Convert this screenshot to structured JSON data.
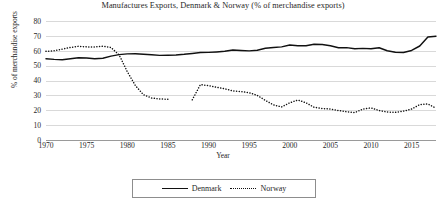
{
  "chart_data": {
    "type": "line",
    "title": "Manufactures Exports, Denmark & Norway (% of merchandise exports)",
    "xlabel": "Year",
    "ylabel": "% of merchandise exports",
    "ylim": [
      0,
      80
    ],
    "xlim": [
      1970,
      2018
    ],
    "ytick_labels": [
      "0",
      "10",
      "20",
      "30",
      "40",
      "50",
      "60",
      "70",
      "80"
    ],
    "ytick_values": [
      0,
      10,
      20,
      30,
      40,
      50,
      60,
      70,
      80
    ],
    "xtick_labels": [
      "1970",
      "1975",
      "1980",
      "1985",
      "1990",
      "1995",
      "2000",
      "2005",
      "2010",
      "2015"
    ],
    "xtick_values": [
      1970,
      1975,
      1980,
      1985,
      1990,
      1995,
      2000,
      2005,
      2010,
      2015
    ],
    "grid": "horizontal",
    "legend_position": "bottom-center",
    "series": [
      {
        "name": "Denmark",
        "style": "solid",
        "color": "#111111",
        "x": [
          1970,
          1971,
          1972,
          1973,
          1974,
          1975,
          1976,
          1977,
          1978,
          1979,
          1980,
          1981,
          1982,
          1983,
          1984,
          1985,
          1986,
          1987,
          1988,
          1989,
          1990,
          1991,
          1992,
          1993,
          1994,
          1995,
          1996,
          1997,
          1998,
          1999,
          2000,
          2001,
          2002,
          2003,
          2004,
          2005,
          2006,
          2007,
          2008,
          2009,
          2010,
          2011,
          2012,
          2013,
          2014,
          2015,
          2016,
          2017,
          2018
        ],
        "values": [
          54.6,
          54.2,
          54.0,
          54.6,
          55.3,
          55.1,
          54.6,
          55.0,
          56.4,
          57.4,
          57.9,
          58.0,
          57.6,
          57.3,
          56.9,
          57.0,
          57.2,
          57.6,
          58.2,
          58.8,
          58.9,
          59.2,
          59.6,
          60.5,
          60.2,
          59.9,
          60.3,
          61.7,
          62.2,
          62.6,
          63.9,
          63.4,
          63.4,
          64.4,
          64.2,
          63.4,
          62.0,
          62.1,
          61.3,
          61.6,
          61.3,
          62.0,
          60.0,
          59.0,
          58.8,
          60.2,
          63.2,
          69.2,
          69.8
        ]
      },
      {
        "name": "Norway",
        "style": "dotted",
        "color": "#111111",
        "gap_years": [
          1986,
          1987
        ],
        "x": [
          1970,
          1971,
          1972,
          1973,
          1974,
          1975,
          1976,
          1977,
          1978,
          1979,
          1980,
          1981,
          1982,
          1983,
          1984,
          1985,
          1988,
          1989,
          1990,
          1991,
          1992,
          1993,
          1994,
          1995,
          1996,
          1997,
          1998,
          1999,
          2000,
          2001,
          2002,
          2003,
          2004,
          2005,
          2006,
          2007,
          2008,
          2009,
          2010,
          2011,
          2012,
          2013,
          2014,
          2015,
          2016,
          2017,
          2018
        ],
        "values": [
          59.6,
          60.0,
          61.1,
          62.2,
          63.0,
          62.6,
          62.6,
          63.0,
          62.2,
          57.2,
          46.0,
          36.6,
          30.4,
          28.2,
          27.6,
          27.4,
          27.0,
          37.2,
          36.6,
          35.4,
          34.4,
          33.0,
          32.6,
          31.8,
          30.0,
          26.6,
          23.6,
          22.2,
          25.0,
          26.9,
          25.0,
          22.0,
          21.2,
          20.8,
          19.8,
          19.0,
          18.4,
          20.8,
          21.6,
          19.8,
          18.8,
          18.6,
          19.4,
          20.8,
          23.8,
          24.2,
          21.4
        ]
      }
    ]
  },
  "legend": {
    "denmark_label": "Denmark",
    "norway_label": "Norway"
  }
}
